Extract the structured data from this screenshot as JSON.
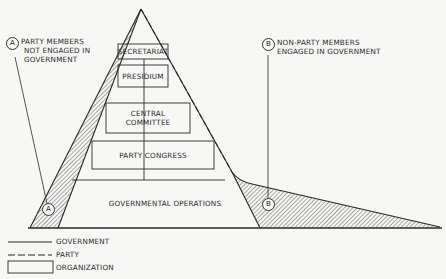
{
  "diagram": {
    "title": "",
    "annotations": {
      "a": {
        "marker": "A",
        "label_lines": [
          "PARTY MEMBERS",
          "NOT ENGAGED IN",
          "GOVERNMENT"
        ]
      },
      "b": {
        "marker": "B",
        "label_lines": [
          "NON-PARTY MEMBERS",
          "ENGAGED IN GOVERNMENT"
        ]
      }
    },
    "organizations": [
      {
        "id": "secretariat",
        "lines": [
          "SECRETARIAT"
        ]
      },
      {
        "id": "presidium",
        "lines": [
          "PRESIDIUM"
        ]
      },
      {
        "id": "central-committee",
        "lines": [
          "CENTRAL",
          "COMMITTEE"
        ]
      },
      {
        "id": "party-congress",
        "lines": [
          "PARTY CONGRESS"
        ]
      }
    ],
    "base_region": {
      "label": "GOVERNMENTAL OPERATIONS"
    },
    "legend": [
      {
        "line_style": "solid",
        "label": "GOVERNMENT"
      },
      {
        "line_style": "dashed",
        "label": "PARTY"
      },
      {
        "line_style": "box",
        "label": "ORGANIZATION"
      }
    ],
    "colors": {
      "background": "#f7f7f5",
      "ink": "#2a2a2a"
    }
  }
}
